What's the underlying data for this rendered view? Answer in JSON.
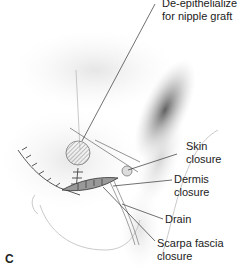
{
  "figure": {
    "panel_label": "C",
    "labels": [
      {
        "id": "deepithelialize",
        "line1": "De-epithelialize",
        "line2": "for nipple graft"
      },
      {
        "id": "skin",
        "line1": "Skin",
        "line2": "closure"
      },
      {
        "id": "dermis",
        "line1": "Dermis",
        "line2": "closure"
      },
      {
        "id": "drain",
        "line1": "Drain",
        "line2": ""
      },
      {
        "id": "scarpa",
        "line1": "Scarpa fascia",
        "line2": "closure"
      }
    ],
    "colors": {
      "ink": "#222222",
      "shade_dark": "#555555",
      "shade_light": "#dddddd",
      "background": "#ffffff"
    }
  }
}
